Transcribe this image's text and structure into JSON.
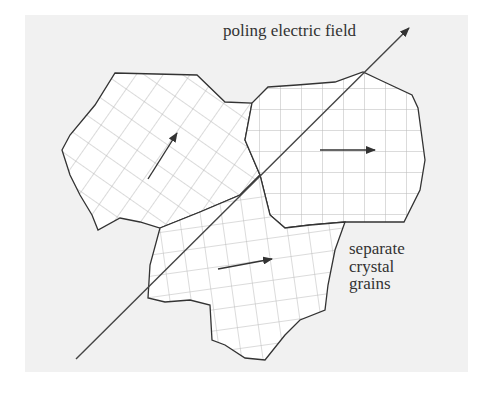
{
  "diagram": {
    "field_label": "poling electric field",
    "grains_label_lines": [
      "separate",
      "crystal",
      "grains"
    ],
    "colors": {
      "background_panel": "#f1f1f1",
      "grain_fill": "#ffffff",
      "outline": "#333333",
      "grid_lines": "#b0b0b0",
      "arrow": "#333333"
    },
    "grains": [
      {
        "name": "upper-left-grain",
        "lattice": "rotated ~35deg",
        "polarization_arrow": "up-right"
      },
      {
        "name": "upper-right-grain",
        "lattice": "axis-aligned",
        "polarization_arrow": "right"
      },
      {
        "name": "lower-grain",
        "lattice": "slightly rotated",
        "polarization_arrow": "right, slight upward"
      }
    ]
  }
}
